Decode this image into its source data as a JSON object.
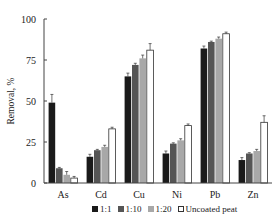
{
  "chart_data": {
    "type": "bar",
    "title": "",
    "xlabel": "",
    "ylabel": "Removal, %",
    "ylim": [
      0,
      100
    ],
    "yticks": [
      0,
      25,
      50,
      75,
      100
    ],
    "grid": false,
    "legend_position": "bottom",
    "categories": [
      "As",
      "Cd",
      "Cu",
      "Ni",
      "Pb",
      "Zn"
    ],
    "series": [
      {
        "name": "1:1",
        "color": "#1a1a1a",
        "values": [
          49,
          16,
          65,
          18,
          82,
          14
        ],
        "errors": [
          5,
          1.5,
          2,
          1.5,
          1.5,
          1.5
        ]
      },
      {
        "name": "1:10",
        "color": "#555555",
        "values": [
          9,
          20,
          72,
          24,
          86,
          18
        ],
        "errors": [
          0.5,
          0.5,
          1,
          0.5,
          0.5,
          0.5
        ]
      },
      {
        "name": "1:20",
        "color": "#a8a8a8",
        "values": [
          5,
          22,
          76,
          26,
          88,
          19.5
        ],
        "errors": [
          2,
          1,
          2,
          1,
          1,
          1
        ]
      },
      {
        "name": "Uncoated peat",
        "color": "#ffffff",
        "values": [
          3,
          33,
          81,
          35,
          91,
          37
        ],
        "errors": [
          1,
          1,
          4,
          1,
          1,
          4
        ]
      }
    ]
  },
  "legend": {
    "items": [
      {
        "label": "1:1",
        "color": "#1a1a1a"
      },
      {
        "label": "1:10",
        "color": "#555555"
      },
      {
        "label": "1:20",
        "color": "#a8a8a8"
      },
      {
        "label": "Uncoated peat",
        "color": "#ffffff"
      }
    ]
  }
}
